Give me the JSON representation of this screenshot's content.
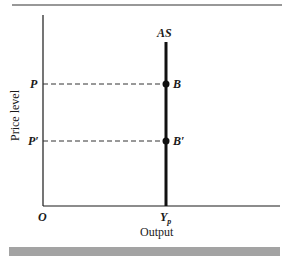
{
  "diagram": {
    "type": "vertical aggregate supply curve",
    "y_axis_label": "Price level",
    "x_axis_label": "Output",
    "origin_label": "O",
    "curve_label": "AS",
    "price_levels": [
      {
        "label": "P",
        "point_label": "B"
      },
      {
        "label": "P′",
        "point_label": "B′"
      }
    ],
    "x_tick": {
      "main": "Y",
      "subscript": "p"
    },
    "colors": {
      "axis": "#1a1a1a",
      "curve": "#111111",
      "footer_bar": "#a3a3a3",
      "top_rule": "#333333"
    }
  }
}
